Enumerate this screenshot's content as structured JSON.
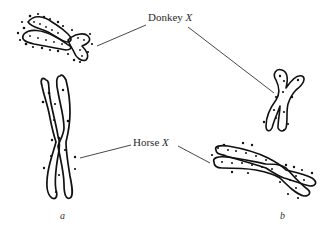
{
  "figure": {
    "labels": {
      "donkey": {
        "text": "Donkey ",
        "var": "X"
      },
      "horse": {
        "text": "Horse ",
        "var": "X"
      }
    },
    "panels": [
      "a",
      "b"
    ],
    "colors": {
      "ink": "#1a1a1a",
      "background": "#ffffff"
    },
    "chromosomes": [
      {
        "id": "donkey-x-a",
        "panel": "a",
        "type": "donkey",
        "description": "condensed beaded chromosome, upper left"
      },
      {
        "id": "horse-x-a",
        "panel": "a",
        "type": "horse",
        "description": "elongated chromosome with sister chromatids, left"
      },
      {
        "id": "donkey-x-b",
        "panel": "b",
        "type": "donkey",
        "description": "short X-shaped chromosome, right"
      },
      {
        "id": "horse-x-b",
        "panel": "b",
        "type": "horse",
        "description": "elongated beaded chromosome, lower right"
      }
    ]
  }
}
